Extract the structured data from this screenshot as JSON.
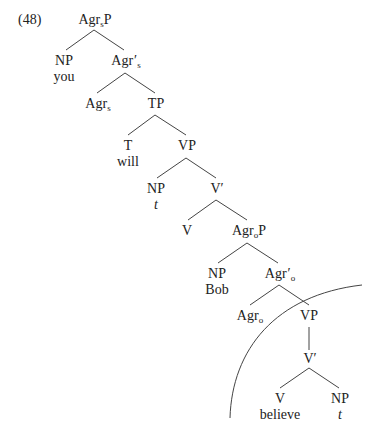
{
  "example_number": "(48)",
  "nodes": {
    "agrsp": {
      "base": "Agr",
      "sub": "s",
      "suffix": "P"
    },
    "np_you": {
      "label": "NP",
      "word": "you"
    },
    "agrs_bar": {
      "base": "Agr",
      "prime": "′",
      "sub": "s"
    },
    "agrs": {
      "base": "Agr",
      "sub": "s"
    },
    "tp": {
      "label": "TP"
    },
    "t": {
      "label": "T",
      "word": "will"
    },
    "vp1": {
      "label": "VP"
    },
    "np_t1": {
      "label": "NP",
      "word": "t"
    },
    "vbar1": {
      "label": "V′"
    },
    "v1": {
      "label": "V"
    },
    "agrop": {
      "base": "Agr",
      "sub": "o",
      "suffix": "P"
    },
    "np_bob": {
      "label": "NP",
      "word": "Bob"
    },
    "agro_bar": {
      "base": "Agr",
      "prime": "′",
      "sub": "o"
    },
    "agro": {
      "base": "Agr",
      "sub": "o"
    },
    "vp2": {
      "label": "VP"
    },
    "vbar2": {
      "label": "V′"
    },
    "v2": {
      "label": "V",
      "word": "believe"
    },
    "np_t2": {
      "label": "NP",
      "word": "t"
    }
  },
  "colors": {
    "line": "#333333",
    "text": "#222222",
    "background": "#ffffff"
  }
}
